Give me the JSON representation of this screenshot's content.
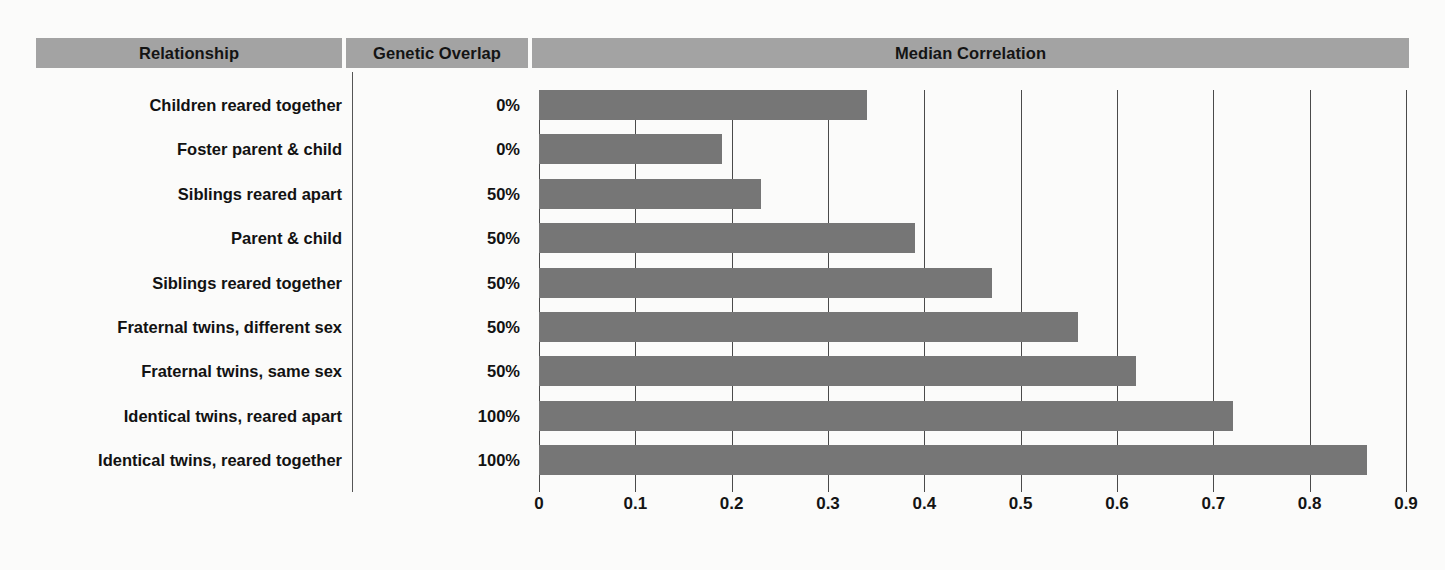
{
  "figure": {
    "background_color": "#fbfbfa",
    "bar_color": "#767676",
    "header_band_color": "#a3a3a3",
    "gridline_color": "#4a4a4a"
  },
  "columns": {
    "relationship_header": "Relationship",
    "overlap_header": "Genetic Overlap",
    "correlation_header": "Median Correlation"
  },
  "rows": [
    {
      "relationship": "Children reared together",
      "genetic_overlap": "0%",
      "median_correlation": 0.34
    },
    {
      "relationship": "Foster parent & child",
      "genetic_overlap": "0%",
      "median_correlation": 0.19
    },
    {
      "relationship": "Siblings reared apart",
      "genetic_overlap": "50%",
      "median_correlation": 0.23
    },
    {
      "relationship": "Parent & child",
      "genetic_overlap": "50%",
      "median_correlation": 0.39
    },
    {
      "relationship": "Siblings reared together",
      "genetic_overlap": "50%",
      "median_correlation": 0.47
    },
    {
      "relationship": "Fraternal twins, different sex",
      "genetic_overlap": "50%",
      "median_correlation": 0.56
    },
    {
      "relationship": "Fraternal twins, same sex",
      "genetic_overlap": "50%",
      "median_correlation": 0.62
    },
    {
      "relationship": "Identical twins, reared apart",
      "genetic_overlap": "100%",
      "median_correlation": 0.72
    },
    {
      "relationship": "Identical twins, reared together",
      "genetic_overlap": "100%",
      "median_correlation": 0.86
    }
  ],
  "chart_data": {
    "type": "bar",
    "orientation": "horizontal",
    "title": "Median Correlation",
    "xlabel": "",
    "ylabel": "",
    "categories": [
      "Children reared together",
      "Foster parent & child",
      "Siblings reared apart",
      "Parent & child",
      "Siblings reared together",
      "Fraternal twins, different sex",
      "Fraternal twins, same sex",
      "Identical twins, reared apart",
      "Identical twins, reared together"
    ],
    "values": [
      0.34,
      0.19,
      0.23,
      0.39,
      0.47,
      0.56,
      0.62,
      0.72,
      0.86
    ],
    "genetic_overlap": [
      "0%",
      "0%",
      "50%",
      "50%",
      "50%",
      "50%",
      "50%",
      "100%",
      "100%"
    ],
    "xlim": [
      0,
      0.9
    ],
    "xticks": [
      0,
      0.1,
      0.2,
      0.3,
      0.4,
      0.5,
      0.6,
      0.7,
      0.8,
      0.9
    ],
    "xtick_labels": [
      "0",
      "0.1",
      "0.2",
      "0.3",
      "0.4",
      "0.5",
      "0.6",
      "0.7",
      "0.8",
      "0.9"
    ],
    "grid": true,
    "grid_axis": "x",
    "legend": false,
    "bar_color": "#767676"
  }
}
